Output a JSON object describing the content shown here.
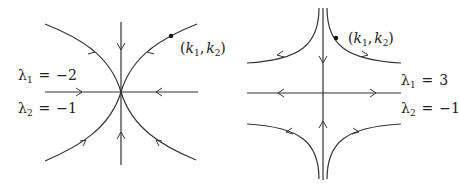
{
  "figure": {
    "type": "phase-portrait-pair",
    "left": {
      "title": "stable node",
      "lambda1": {
        "symbol": "λ",
        "sub": "1",
        "eq": "=",
        "value": "−2"
      },
      "lambda2": {
        "symbol": "λ",
        "sub": "2",
        "eq": "=",
        "value": "−1"
      },
      "point": {
        "open": "(",
        "k1": "k",
        "k1_sub": "1",
        "comma": ",",
        "k2": "k",
        "k2_sub": "2",
        "close": ")"
      }
    },
    "right": {
      "title": "saddle",
      "lambda1": {
        "symbol": "λ",
        "sub": "1",
        "eq": "=",
        "value": "3"
      },
      "lambda2": {
        "symbol": "λ",
        "sub": "2",
        "eq": "=",
        "value": "−1"
      },
      "point": {
        "open": "(",
        "k1": "k",
        "k1_sub": "1",
        "comma": ",",
        "k2": "k",
        "k2_sub": "2",
        "close": ")"
      }
    },
    "colors": {
      "ink": "#333333",
      "background": "#ffffff"
    }
  }
}
